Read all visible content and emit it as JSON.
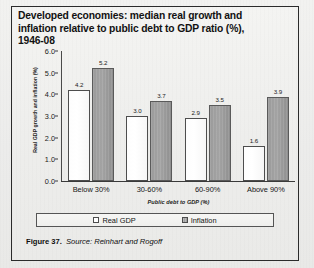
{
  "figure": {
    "title_lines": [
      "Developed economies: median real growth and",
      "inflation relative to public debt to GDP ratio (%),",
      "1946-08"
    ],
    "caption_number": "Figure 37.",
    "caption_source": "Source: Reinhart and Rogoff"
  },
  "legend": {
    "position": "bottom",
    "items": [
      {
        "label": "Real GDP",
        "swatch": "white-outlined"
      },
      {
        "label": "Inflation",
        "swatch": "gray-filled"
      }
    ]
  },
  "chart_data": {
    "type": "bar",
    "title": "Developed economies: median real growth and inflation relative to public debt to GDP ratio (%), 1946-08",
    "xlabel": "Public debt to GDP (%)",
    "ylabel": "Real GDP growth and inflation (%)",
    "categories": [
      "Below 30%",
      "30-60%",
      "60-90%",
      "Above 90%"
    ],
    "series": [
      {
        "name": "Real GDP",
        "values": [
          4.2,
          3.0,
          2.9,
          1.6
        ],
        "color": "#ffffff"
      },
      {
        "name": "Inflation",
        "values": [
          5.2,
          3.7,
          3.5,
          3.9
        ],
        "color": "#9b9b9b"
      }
    ],
    "ylim": [
      0.0,
      6.0
    ],
    "yticks": [
      "0.0",
      "1.0",
      "2.0",
      "3.0",
      "4.0",
      "5.0",
      "6.0"
    ],
    "ytick_values": [
      0.0,
      1.0,
      2.0,
      3.0,
      4.0,
      5.0,
      6.0
    ],
    "grid": false,
    "legend_position": "bottom",
    "value_labels": [
      [
        "4.2",
        "5.2"
      ],
      [
        "3.0",
        "3.7"
      ],
      [
        "2.9",
        "3.5"
      ],
      [
        "1.6",
        "3.9"
      ]
    ]
  }
}
